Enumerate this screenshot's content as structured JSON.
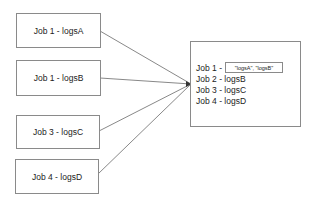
{
  "diagram": {
    "sources": [
      {
        "label": "Job 1 - logsA"
      },
      {
        "label": "Job 1 - logsB"
      },
      {
        "label": "Job 3 - logsC"
      },
      {
        "label": "Job 4 - logsD"
      }
    ],
    "target": {
      "lines": [
        {
          "label": "Job 1 -"
        },
        {
          "label": "Job 2 - logsB"
        },
        {
          "label": "Job 3 - logsC"
        },
        {
          "label": "Job 4 - logsD"
        }
      ],
      "inner_value": "\"logsA\", \"logsB\""
    }
  }
}
